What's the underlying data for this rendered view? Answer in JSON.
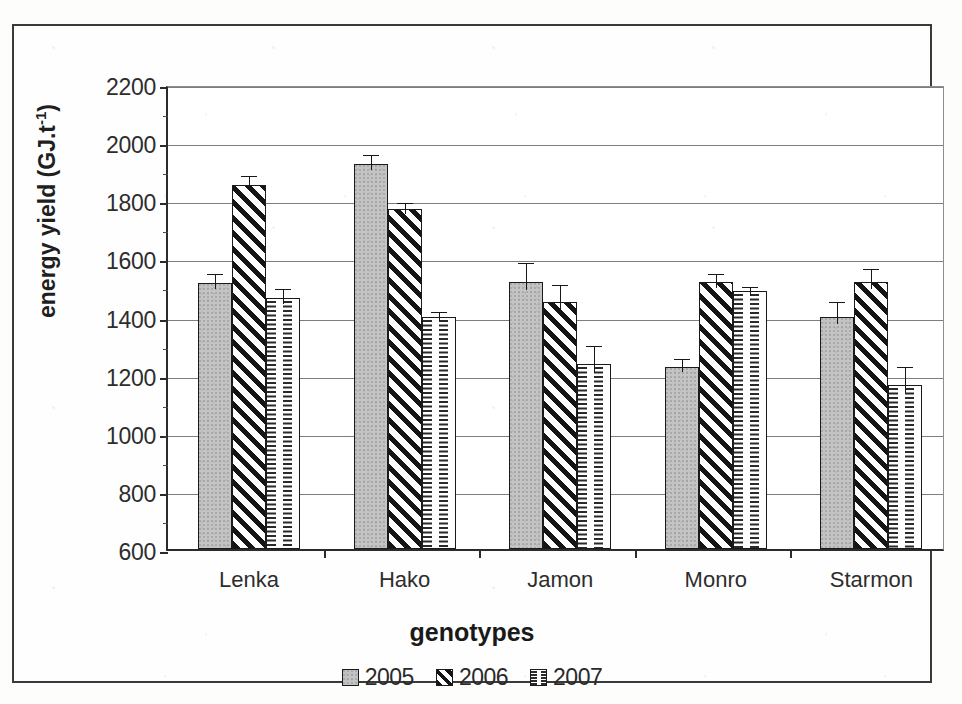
{
  "chart_data": {
    "type": "bar",
    "title": "",
    "xlabel": "genotypes",
    "ylabel": "energy yield  (GJ.t",
    "ylabel_sup": "-1",
    "ylabel_suffix": ")",
    "categories": [
      "Lenka",
      "Hako",
      "Jamon",
      "Monro",
      "Starmon"
    ],
    "ylim": [
      600,
      2200
    ],
    "ytick_step": 200,
    "ytick_labels": [
      "2200",
      "2000",
      "1800",
      "1600",
      "1400",
      "1200",
      "1000",
      "800",
      "600"
    ],
    "ytick_values": [
      2200,
      2000,
      1800,
      1600,
      1400,
      1200,
      1000,
      800,
      600
    ],
    "grid": true,
    "legend_position": "bottom",
    "series": [
      {
        "name": "2005",
        "pattern": "solid-gray",
        "color": "#c4c4c4",
        "values": [
          1515,
          1925,
          1520,
          1228,
          1400
        ],
        "errors": [
          40,
          40,
          75,
          35,
          60
        ]
      },
      {
        "name": "2006",
        "pattern": "diagonal-hatch",
        "color": "#151515",
        "values": [
          1853,
          1770,
          1450,
          1518,
          1520
        ],
        "errors": [
          40,
          30,
          70,
          40,
          55
        ]
      },
      {
        "name": "2007",
        "pattern": "dashed-brick",
        "color": "#2a2a2a",
        "values": [
          1465,
          1400,
          1235,
          1487,
          1165
        ],
        "errors": [
          40,
          25,
          75,
          25,
          70
        ]
      }
    ]
  },
  "legend": {
    "items": [
      {
        "label": "2005"
      },
      {
        "label": "2006"
      },
      {
        "label": "2007"
      }
    ]
  }
}
